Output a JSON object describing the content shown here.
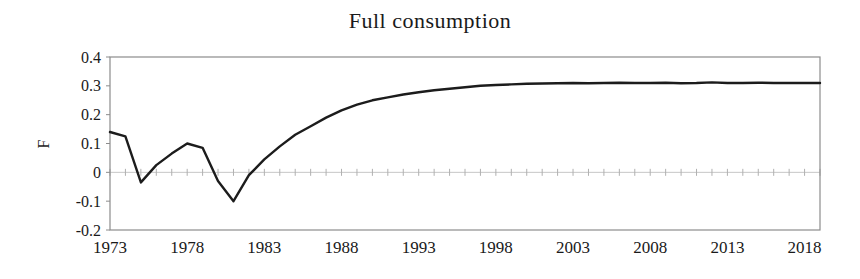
{
  "title": "Full consumption",
  "y_axis_title": "F",
  "colors": {
    "background": "#ffffff",
    "plot_border": "#8c8c8c",
    "series_line": "#1c1c1c",
    "zero_axis_line": "#c6c6c6",
    "zero_axis_ticks": "#b0b0b0",
    "axis_tick": "#8c8c8c",
    "text": "#1a1a1a"
  },
  "chart_data": {
    "type": "line",
    "title": "Full consumption",
    "xlabel": "",
    "ylabel": "F",
    "legend_position": "none",
    "grid": "horizontal zero-axis only, with small tick marks at every year",
    "ylim": [
      -0.2,
      0.4
    ],
    "xlim": [
      1973,
      2019
    ],
    "y_ticks": [
      "0.4",
      "0.3",
      "0.2",
      "0.1",
      "0",
      "-0.1",
      "-0.2"
    ],
    "y_tick_values": [
      0.4,
      0.3,
      0.2,
      0.1,
      0,
      -0.1,
      -0.2
    ],
    "x_ticks": [
      "1973",
      "1978",
      "1983",
      "1988",
      "1993",
      "1998",
      "2003",
      "2008",
      "2013",
      "2018"
    ],
    "x_tick_values": [
      1973,
      1978,
      1983,
      1988,
      1993,
      1998,
      2003,
      2008,
      2013,
      2018
    ],
    "series": [
      {
        "name": "F",
        "x": [
          1973,
          1974,
          1975,
          1976,
          1977,
          1978,
          1979,
          1980,
          1981,
          1982,
          1983,
          1984,
          1985,
          1986,
          1987,
          1988,
          1989,
          1990,
          1991,
          1992,
          1993,
          1994,
          1995,
          1996,
          1997,
          1998,
          1999,
          2000,
          2001,
          2002,
          2003,
          2004,
          2005,
          2006,
          2007,
          2008,
          2009,
          2010,
          2011,
          2012,
          2013,
          2014,
          2015,
          2016,
          2017,
          2018,
          2019
        ],
        "values": [
          0.14,
          0.125,
          -0.035,
          0.025,
          0.065,
          0.1,
          0.085,
          -0.03,
          -0.1,
          -0.01,
          0.045,
          0.09,
          0.13,
          0.16,
          0.19,
          0.215,
          0.235,
          0.25,
          0.26,
          0.27,
          0.278,
          0.285,
          0.29,
          0.295,
          0.3,
          0.303,
          0.305,
          0.307,
          0.308,
          0.309,
          0.31,
          0.309,
          0.31,
          0.311,
          0.31,
          0.31,
          0.311,
          0.309,
          0.31,
          0.312,
          0.31,
          0.31,
          0.311,
          0.31,
          0.31,
          0.31,
          0.31
        ]
      }
    ]
  }
}
